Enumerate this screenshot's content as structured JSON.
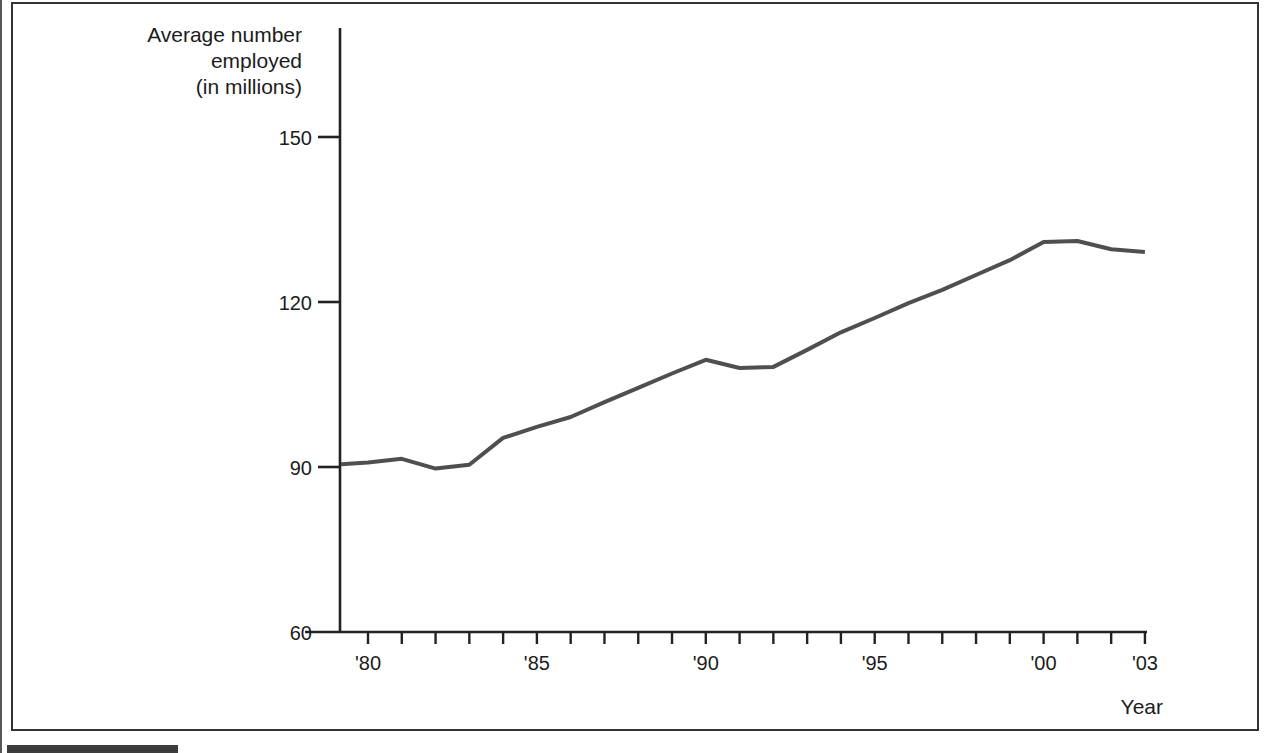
{
  "figure": {
    "y_axis_title_lines": [
      "Average number",
      "employed",
      "(in millions)"
    ]
  },
  "colors": {
    "line": "#4f4f4f",
    "axis": "#222222",
    "text": "#1c1c1c",
    "frame": "#333333",
    "bottom_bar": "#3c3c3c"
  },
  "chart_data": {
    "type": "line",
    "title": "",
    "xlabel": "Year",
    "ylabel": "Average number employed (in millions)",
    "grid": false,
    "legend": "none",
    "ylim": [
      60,
      155
    ],
    "xlim": [
      1979.2,
      2003
    ],
    "y_ticks": [
      60,
      90,
      120,
      150
    ],
    "x_tick_labels": [
      {
        "year": 1980,
        "label": "'80"
      },
      {
        "year": 1985,
        "label": "'85"
      },
      {
        "year": 1990,
        "label": "'90"
      },
      {
        "year": 1995,
        "label": "'95"
      },
      {
        "year": 2000,
        "label": "'00"
      },
      {
        "year": 2003,
        "label": "'03"
      }
    ],
    "minor_tick_years": {
      "from": 1980,
      "to": 2003,
      "step": 1
    },
    "series": [
      {
        "name": "Average number employed (in millions)",
        "points": [
          [
            1979.2,
            90.5
          ],
          [
            1980,
            90.8
          ],
          [
            1981,
            91.5
          ],
          [
            1982,
            89.7
          ],
          [
            1983,
            90.4
          ],
          [
            1984,
            95.3
          ],
          [
            1985,
            97.3
          ],
          [
            1986,
            99.1
          ],
          [
            1987,
            101.8
          ],
          [
            1988,
            104.4
          ],
          [
            1989,
            107.0
          ],
          [
            1990,
            109.5
          ],
          [
            1991,
            108.0
          ],
          [
            1992,
            108.2
          ],
          [
            1993,
            111.3
          ],
          [
            1994,
            114.5
          ],
          [
            1995,
            117.1
          ],
          [
            1996,
            119.8
          ],
          [
            1997,
            122.2
          ],
          [
            1998,
            124.9
          ],
          [
            1999,
            127.6
          ],
          [
            2000,
            130.9
          ],
          [
            2001,
            131.1
          ],
          [
            2002,
            129.6
          ],
          [
            2003,
            129.1
          ]
        ]
      }
    ]
  }
}
